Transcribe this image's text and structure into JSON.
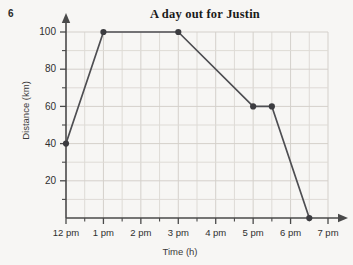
{
  "question_number": "6",
  "chart_data": {
    "type": "line",
    "title": "A day out for Justin",
    "xlabel": "Time (h)",
    "ylabel": "Distance (km)",
    "grid": true,
    "legend": false,
    "xlim": [
      12,
      19
    ],
    "ylim": [
      0,
      100
    ],
    "x_tick_labels": [
      "12 pm",
      "1 pm",
      "2 pm",
      "3 pm",
      "4 pm",
      "5 pm",
      "6 pm",
      "7 pm"
    ],
    "x_tick_values": [
      12,
      13,
      14,
      15,
      16,
      17,
      18,
      19
    ],
    "x_minor_tick_values": [
      12.5,
      13.5,
      14.5,
      15.5,
      16.5,
      17.5,
      18.5
    ],
    "y_tick_labels": [
      "20",
      "40",
      "60",
      "80",
      "100"
    ],
    "y_tick_values": [
      20,
      40,
      60,
      80,
      100
    ],
    "y_minor_tick_values": [
      10,
      30,
      50,
      70,
      90
    ],
    "series": [
      {
        "name": "Justin's journey",
        "color": "#4e4e52",
        "x": [
          12,
          13,
          15,
          17,
          17.5,
          18.5
        ],
        "y": [
          40,
          100,
          100,
          60,
          60,
          0
        ],
        "point_labels": [
          "12 pm, 40 km",
          "1 pm, 100 km",
          "3 pm, 100 km",
          "5 pm, 60 km",
          "5:30 pm, 60 km",
          "6:30 pm, 0 km"
        ]
      }
    ]
  }
}
